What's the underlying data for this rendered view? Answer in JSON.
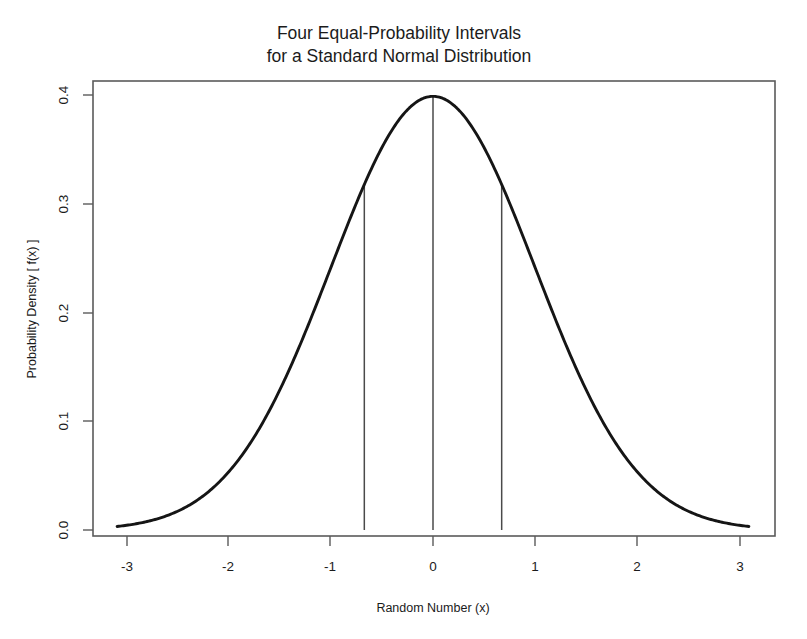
{
  "figure": {
    "title_line1": "Four Equal-Probability Intervals",
    "title_line2": "for a Standard Normal Distribution",
    "background_color": "#ffffff"
  },
  "chart_data": {
    "type": "line",
    "title": "Four Equal-Probability Intervals for a Standard Normal Distribution",
    "subtitle": "",
    "xlabel": "Random Number (x)",
    "ylabel": "Probability Density [ f(x) ]",
    "xlim": [
      -3.35,
      3.35
    ],
    "ylim": [
      0.0,
      0.42
    ],
    "xticks": [
      -3,
      -2,
      -1,
      0,
      1,
      2,
      3
    ],
    "xticklabels": [
      "-3",
      "-2",
      "-1",
      "0",
      "1",
      "2",
      "3"
    ],
    "yticks": [
      0.0,
      0.1,
      0.2,
      0.3,
      0.4
    ],
    "yticklabels": [
      "0.0",
      "0.1",
      "0.2",
      "0.3",
      "0.4"
    ],
    "grid": false,
    "legend": false,
    "legend_position": "none",
    "curve_color": "#151515",
    "divider_color": "#4a4a4a",
    "frame_color": "#5b5b5b",
    "distribution": "standard normal (mean 0, sd 1)",
    "curve_domain": [
      -3.1,
      3.1
    ],
    "series": [
      {
        "name": "standard normal pdf",
        "x": [
          -3.1,
          -3.0,
          -2.8,
          -2.6,
          -2.4,
          -2.2,
          -2.0,
          -1.8,
          -1.6,
          -1.4,
          -1.2,
          -1.0,
          -0.8,
          -0.674,
          -0.6,
          -0.4,
          -0.2,
          0.0,
          0.2,
          0.4,
          0.6,
          0.674,
          0.8,
          1.0,
          1.2,
          1.4,
          1.6,
          1.8,
          2.0,
          2.2,
          2.4,
          2.6,
          2.8,
          3.0,
          3.1
        ],
        "values": [
          0.0033,
          0.0044,
          0.0079,
          0.0136,
          0.0224,
          0.0355,
          0.054,
          0.079,
          0.1109,
          0.1497,
          0.1942,
          0.242,
          0.2897,
          0.3178,
          0.3332,
          0.3683,
          0.391,
          0.3989,
          0.391,
          0.3683,
          0.3332,
          0.3178,
          0.2897,
          0.242,
          0.1942,
          0.1497,
          0.1109,
          0.079,
          0.054,
          0.0355,
          0.0224,
          0.0136,
          0.0079,
          0.0044,
          0.0033
        ]
      }
    ],
    "annotations": {
      "interval_dividers": [
        {
          "x": -0.674,
          "y_top": 0.3178,
          "label": "first quartile"
        },
        {
          "x": 0.0,
          "y_top": 0.3989,
          "label": "median"
        },
        {
          "x": 0.674,
          "y_top": 0.3178,
          "label": "third quartile"
        }
      ],
      "interval_probability_each": 0.25,
      "interval_count": 4
    }
  }
}
